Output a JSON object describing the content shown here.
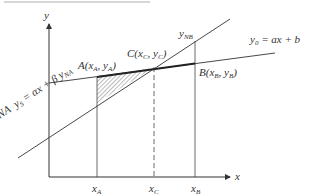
{
  "header_fragment": "",
  "axes": {
    "x_label": "x",
    "y_label": "y"
  },
  "lines": {
    "y0": {
      "name": "y0",
      "label_lhs": "y",
      "label_sub": "0",
      "label_rhs": "= ax + b"
    },
    "yS": {
      "name": "yS",
      "label_prefix": "NA",
      "label_lhs": "y",
      "label_sub": "S",
      "label_rhs": "= αx + β"
    }
  },
  "points": {
    "A": {
      "label": "A(x",
      "sub1": "A",
      "mid": ", y",
      "sub2": "A",
      "end": ")"
    },
    "B": {
      "label": "B(x",
      "sub1": "B",
      "mid": ", y",
      "sub2": "B",
      "end": ")"
    },
    "C": {
      "label": "C(x",
      "sub1": "C",
      "mid": ", y",
      "sub2": "C",
      "end": ")"
    }
  },
  "markers": {
    "yNA": {
      "base": "y",
      "sub": "NA"
    },
    "yNB": {
      "base": "y",
      "sub": "NB"
    }
  },
  "ticks": [
    {
      "base": "x",
      "sub": "A"
    },
    {
      "base": "x",
      "sub": "C"
    },
    {
      "base": "x",
      "sub": "B"
    }
  ],
  "colors": {
    "ink": "#333333",
    "hatch": "#555555"
  }
}
